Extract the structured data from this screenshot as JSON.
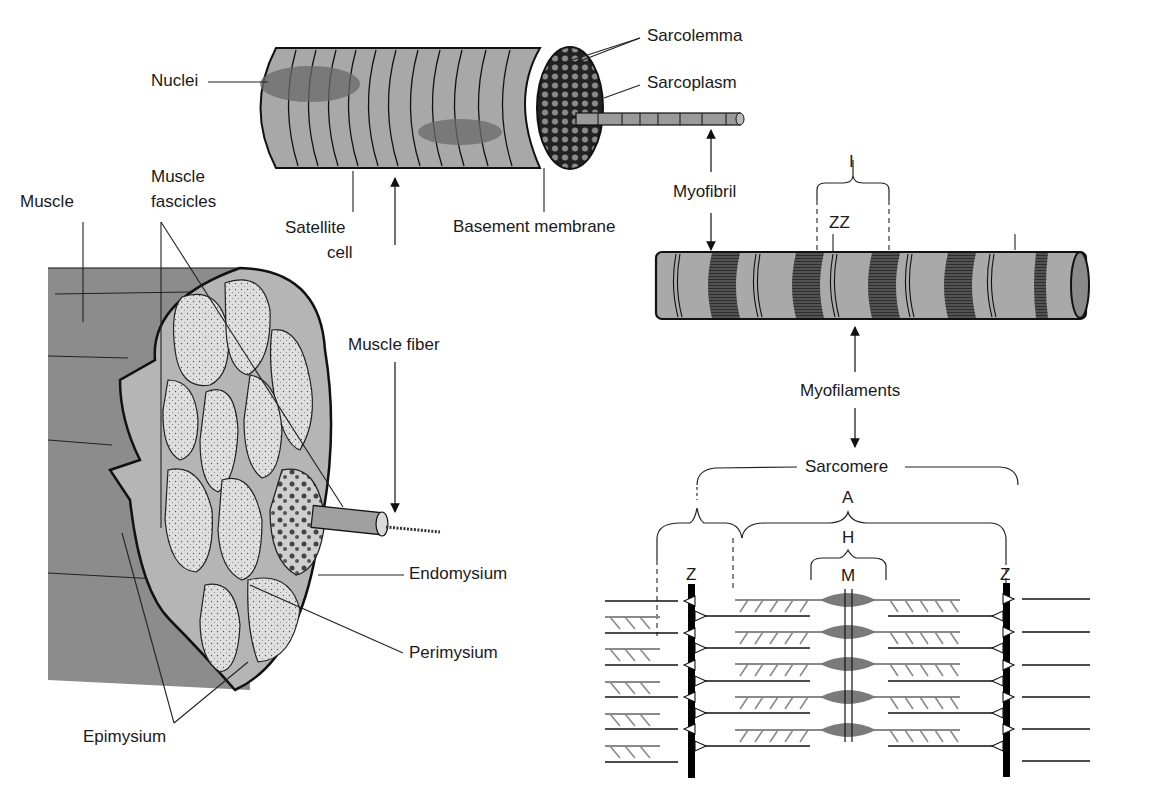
{
  "diagram": {
    "colors": {
      "muscle_outer": "#8c8c8c",
      "muscle_section": "#b5b5b5",
      "fascicle_fill": "#dcdcdc",
      "fiber_body": "#a6a6a6",
      "nucleus": "#6e6e6e",
      "myofibril_body": "#a9a9a9",
      "dark_band": "#3a3a3a",
      "thick_filament": "#8a8a8a",
      "line": "#1a1a1a"
    },
    "labels": {
      "nuclei": "Nuclei",
      "sarcolemma": "Sarcolemma",
      "sarcoplasm": "Sarcoplasm",
      "muscle": "Muscle",
      "muscle_fascicles_line1": "Muscle",
      "muscle_fascicles_line2": "fascicles",
      "satellite_cell_line1": "Satellite",
      "satellite_cell_line2": "cell",
      "basement_membrane": "Basement membrane",
      "myofibril": "Myofibril",
      "i_band": "I",
      "zz": "ZZ",
      "muscle_fiber": "Muscle fiber",
      "myofilaments": "Myofilaments",
      "sarcomere": "Sarcomere",
      "a_band": "A",
      "h_zone": "H",
      "m_line": "M",
      "z_left": "Z",
      "z_right": "Z",
      "endomysium": "Endomysium",
      "perimysium": "Perimysium",
      "epimysium": "Epimysium"
    }
  }
}
